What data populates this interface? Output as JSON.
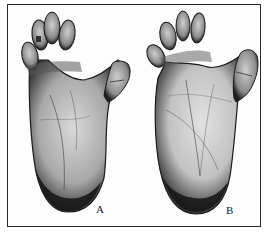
{
  "figure": {
    "panels": [
      {
        "id": "A",
        "label": "A",
        "subject": "foot-sole",
        "label_pos": {
          "x": 96,
          "y": 204
        }
      },
      {
        "id": "B",
        "label": "B",
        "subject": "foot-sole",
        "label_pos": {
          "x": 226,
          "y": 205
        }
      }
    ],
    "colors": {
      "frame": "#2a2a2a",
      "ink_dark": "#141414",
      "ink_mid": "#6e6e6e",
      "skin_light": "#d8d8d8",
      "paper": "#fdfdfd"
    }
  }
}
